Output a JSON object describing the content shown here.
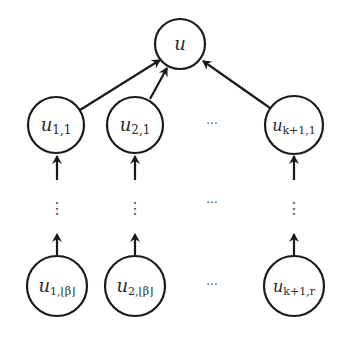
{
  "diagram": {
    "type": "tree",
    "colors": {
      "stroke": "#1a1a1a",
      "text": "#2a2a2a",
      "background": "#ffffff"
    },
    "root": {
      "id": "u",
      "label": "u",
      "sub": ""
    },
    "middle_row": [
      {
        "id": "u_1_1",
        "label": "u",
        "sub": "1,1"
      },
      {
        "id": "u_2_1",
        "label": "u",
        "sub": "2,1"
      },
      {
        "id": "u_k1_1",
        "label": "u",
        "sub": "k+1,1"
      }
    ],
    "bottom_row": [
      {
        "id": "u_1_beta",
        "label": "u",
        "sub": "1,⌊β⌋"
      },
      {
        "id": "u_2_beta",
        "label": "u",
        "sub": "2,⌊β⌋"
      },
      {
        "id": "u_k1_r",
        "label": "u",
        "sub": "k+1,r"
      }
    ],
    "ellipsis_horizontal": "···",
    "ellipsis_vertical": "⋮",
    "edges": [
      {
        "from": "u_1_1",
        "to": "u"
      },
      {
        "from": "u_2_1",
        "to": "u"
      },
      {
        "from": "u_k1_1",
        "to": "u"
      },
      {
        "from": "chain_1",
        "to": "u_1_1"
      },
      {
        "from": "chain_2",
        "to": "u_2_1"
      },
      {
        "from": "chain_k1",
        "to": "u_k1_1"
      },
      {
        "from": "u_1_beta",
        "to": "chain_1"
      },
      {
        "from": "u_2_beta",
        "to": "chain_2"
      },
      {
        "from": "u_k1_r",
        "to": "chain_k1"
      }
    ]
  }
}
